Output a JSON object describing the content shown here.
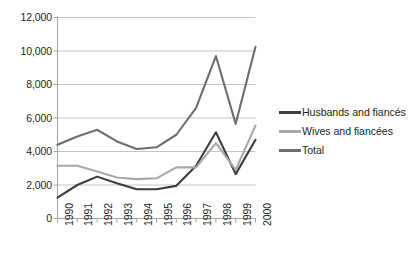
{
  "chart_data": {
    "type": "line",
    "title": "",
    "subtitle": "",
    "xlabel": "",
    "ylabel": "",
    "categories": [
      "1990",
      "1991",
      "1992",
      "1993",
      "1994",
      "1995",
      "1996",
      "1997",
      "1998",
      "1999",
      "2000"
    ],
    "ylim": [
      0,
      12000
    ],
    "yticks": [
      "0",
      "2,000",
      "4,000",
      "6,000",
      "8,000",
      "10,000",
      "12,000"
    ],
    "ytick_values": [
      0,
      2000,
      4000,
      6000,
      8000,
      10000,
      12000
    ],
    "grid": "horizontal",
    "legend_position": "right",
    "series": [
      {
        "name": "Husbands and fiancés",
        "color": "#3d3d3f",
        "values": [
          1250,
          2000,
          2500,
          2100,
          1750,
          1750,
          1950,
          3150,
          5150,
          2650,
          4700
        ]
      },
      {
        "name": "Wives and fiancées",
        "color": "#a8a8aa",
        "values": [
          3150,
          3150,
          2800,
          2450,
          2350,
          2400,
          3050,
          3050,
          4500,
          2900,
          5550
        ]
      },
      {
        "name": "Total",
        "color": "#6e6e70",
        "values": [
          4400,
          4900,
          5300,
          4600,
          4150,
          4250,
          5000,
          6600,
          9700,
          5650,
          10250
        ]
      }
    ],
    "axis_color": "#a6a6a6",
    "grid_color": "#bdbdbd",
    "text_color": "#231f20",
    "background": "#ffffff"
  }
}
